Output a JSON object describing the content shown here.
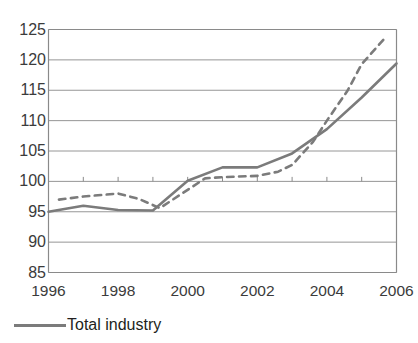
{
  "chart_data": {
    "type": "line",
    "title": "",
    "subtitle": "",
    "xlabel": "",
    "ylabel": "",
    "xlim": [
      1996,
      2006
    ],
    "ylim": [
      85,
      125
    ],
    "y_ticks": [
      85,
      90,
      95,
      100,
      105,
      110,
      115,
      120,
      125
    ],
    "x_ticks": [
      1996,
      1998,
      2000,
      2002,
      2004,
      2006
    ],
    "x_tick_labels": [
      "1996",
      "1998",
      "2000",
      "2002",
      "2004",
      "2006"
    ],
    "y_tick_labels": [
      "85",
      "90",
      "95",
      "100",
      "105",
      "110",
      "115",
      "120",
      "125"
    ],
    "grid": "horizontal",
    "legend_position": "bottom-left",
    "x": [
      1996,
      1997,
      1998,
      1999,
      2000,
      2001,
      2002,
      2003,
      2004,
      2005,
      2006
    ],
    "series": [
      {
        "name": "Total industry",
        "style": "solid",
        "color": "#7b7b7b",
        "values": [
          95.0,
          96.0,
          95.3,
          95.2,
          100.1,
          102.3,
          102.3,
          104.6,
          108.6,
          113.8,
          119.4
        ]
      },
      {
        "name": "",
        "style": "dashed",
        "color": "#7b7b7b",
        "x": [
          1996.3,
          1997,
          1998,
          1998.6,
          1999.2,
          2000.5,
          2001,
          2002,
          2002.6,
          2003,
          2003.6,
          2004,
          2004.6,
          2005,
          2005.7
        ],
        "values": [
          97.0,
          97.5,
          98.0,
          97.1,
          95.6,
          100.5,
          100.7,
          100.9,
          101.6,
          102.7,
          106.5,
          110.0,
          115.0,
          119.3,
          123.8
        ]
      }
    ]
  },
  "legend": {
    "entries": [
      {
        "label": "Total industry",
        "style": "solid"
      }
    ]
  },
  "colors": {
    "line": "#7b7b7b",
    "grid": "#8a8a8a",
    "axis": "#8a8a8a",
    "text": "#3b3b3b"
  }
}
